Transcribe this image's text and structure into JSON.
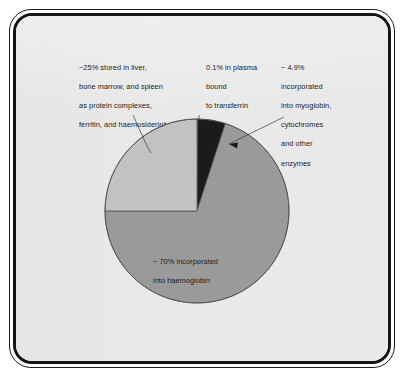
{
  "figure": {
    "background_color": "#e9e9e9",
    "frame_color": "#141414",
    "text_color": "#1d1d1d"
  },
  "labels": {
    "storage": {
      "lines": [
        "~25% stored in liver,",
        "bone marrow, and spleen",
        "as protein complexes,",
        "ferritin, and haemosiderin*"
      ],
      "value_text": "~25%"
    },
    "plasma": {
      "lines": [
        "0.1% in plasma",
        "bound",
        "to transferrin"
      ],
      "value_text": "0.1%"
    },
    "myoglobin": {
      "lines": [
        "~ 4.9%",
        "incorporated",
        "into myoglobin,",
        "cytochromes",
        "and other",
        "enzymes"
      ],
      "value_text": "~ 4.9%"
    },
    "hemoglobin": {
      "lines": [
        "~ 70% incorporated",
        "into haemoglobin"
      ],
      "value_text": "~ 70%"
    }
  },
  "chart_data": {
    "type": "pie",
    "title": "",
    "subtitle": "",
    "xlabel": "",
    "ylabel": "",
    "grid": false,
    "legend_position": "none",
    "units": "percent of total body iron",
    "start_angle_deg": 0,
    "direction": "clockwise",
    "center": {
      "cx": 197,
      "cy": 211
    },
    "radius": 92,
    "total": 100.0,
    "categories": [
      "0.1% in plasma bound to transferrin",
      "~ 4.9% incorporated into myoglobin, cytochromes and other enzymes",
      "~ 70% incorporated into haemoglobin",
      "~25% stored in liver, bone marrow, and spleen as protein complexes, ferritin, and haemosiderin*"
    ],
    "short_labels": [
      "transferrin",
      "myoglobin/cytochromes",
      "haemoglobin",
      "storage"
    ],
    "values": [
      0.1,
      4.9,
      70.0,
      25.0
    ],
    "value_texts": [
      "0.1%",
      "~ 4.9%",
      "~ 70%",
      "~25%"
    ],
    "colors": [
      "#1b1b1b",
      "#1b1b1b",
      "#9a9a9a",
      "#c2c2c2"
    ],
    "slice_angles_deg": [
      {
        "start": 0.0,
        "end": 0.36
      },
      {
        "start": 0.36,
        "end": 18.0
      },
      {
        "start": 18.0,
        "end": 270.0
      },
      {
        "start": 270.0,
        "end": 360.0
      }
    ],
    "stroke_color": "#555555",
    "footnote": "*"
  }
}
